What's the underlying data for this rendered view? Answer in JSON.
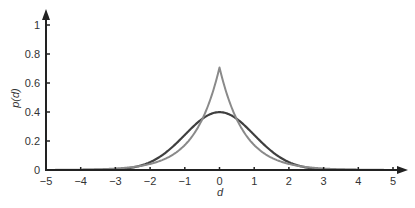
{
  "chart_data": {
    "type": "line",
    "title": "",
    "xlabel": "d",
    "ylabel": "p(d)",
    "xlim": [
      -5,
      5
    ],
    "ylim": [
      0,
      1.1
    ],
    "x_ticks": [
      -5,
      -4,
      -3,
      -2,
      -1,
      0,
      1,
      2,
      3,
      4,
      5
    ],
    "x_tick_labels": [
      "−5",
      "−4",
      "−3",
      "−2",
      "−1",
      "0",
      "1",
      "2",
      "3",
      "4",
      "5"
    ],
    "y_ticks": [
      0,
      0.2,
      0.4,
      0.6,
      0.8,
      1
    ],
    "y_tick_labels": [
      "0",
      "0.2",
      "0.4",
      "0.6",
      "0.8",
      "1"
    ],
    "grid": false,
    "legend": null,
    "series": [
      {
        "name": "Gaussian (standard normal)",
        "color": "#3f3f3f",
        "x": [
          -5,
          -4.5,
          -4,
          -3.5,
          -3,
          -2.5,
          -2,
          -1.5,
          -1,
          -0.5,
          0,
          0.5,
          1,
          1.5,
          2,
          2.5,
          3,
          3.5,
          4,
          4.5,
          5
        ],
        "values": [
          0.0,
          0.0,
          0.0001,
          0.0009,
          0.0044,
          0.0175,
          0.054,
          0.1295,
          0.242,
          0.3521,
          0.3989,
          0.3521,
          0.242,
          0.1295,
          0.054,
          0.0175,
          0.0044,
          0.0009,
          0.0001,
          0.0,
          0.0
        ]
      },
      {
        "name": "Laplacian",
        "color": "#8a8a8a",
        "x": [
          -5,
          -4.5,
          -4,
          -3.5,
          -3,
          -2.5,
          -2,
          -1.5,
          -1,
          -0.5,
          0,
          0.5,
          1,
          1.5,
          2,
          2.5,
          3,
          3.5,
          4,
          4.5,
          5
        ],
        "values": [
          0.0006,
          0.0012,
          0.0025,
          0.005,
          0.0101,
          0.0205,
          0.0418,
          0.0847,
          0.172,
          0.349,
          0.7071,
          0.349,
          0.172,
          0.0847,
          0.0418,
          0.0205,
          0.0101,
          0.005,
          0.0025,
          0.0012,
          0.0006
        ]
      }
    ]
  },
  "colors": {
    "axis": "#222222",
    "gaussian": "#3f3f3f",
    "laplacian": "#8a8a8a"
  }
}
